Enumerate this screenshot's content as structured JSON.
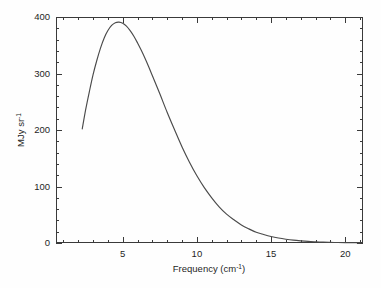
{
  "chart_data": {
    "type": "line",
    "title": "",
    "subtitle": "",
    "xlabel": "Frequency (cm",
    "xlabel_sup": "-1",
    "xlabel_tail": ")",
    "ylabel": "MJy sr",
    "ylabel_sup": "-1",
    "xlim": [
      0.5,
      21.2
    ],
    "ylim": [
      0,
      400
    ],
    "xticks": [
      5,
      10,
      15,
      20
    ],
    "xtick_labels": [
      "5",
      "10",
      "15",
      "20"
    ],
    "xminor_step": 1,
    "yticks": [
      0,
      100,
      200,
      300,
      400
    ],
    "ytick_labels": [
      "0",
      "100",
      "200",
      "300",
      "400"
    ],
    "yminor_step": 20,
    "grid": false,
    "legend": null,
    "line_color": "#4a4a4a",
    "axis_color": "#3a3a3a",
    "background": "#fefefe",
    "series": [
      {
        "name": "CMB blackbody spectrum",
        "description": "Planck blackbody intensity at T = 2.725 K plotted against wavenumber",
        "x": [
          2.27,
          2.5,
          2.75,
          3.0,
          3.25,
          3.5,
          3.75,
          4.0,
          4.25,
          4.5,
          4.75,
          5.0,
          5.25,
          5.5,
          5.75,
          6.0,
          6.25,
          6.5,
          6.75,
          7.0,
          7.5,
          8.0,
          8.5,
          9.0,
          9.5,
          10.0,
          10.5,
          11.0,
          11.5,
          12.0,
          12.5,
          13.0,
          13.5,
          14.0,
          14.5,
          15.0,
          15.5,
          16.0,
          16.5,
          17.0,
          17.5,
          18.0,
          18.5,
          19.0,
          19.5,
          20.0,
          20.5,
          21.0
        ],
        "y": [
          202,
          236,
          268,
          298,
          323,
          345,
          363,
          376,
          385,
          390,
          391,
          389,
          384,
          376,
          366,
          354,
          341,
          327,
          312,
          296,
          264,
          231,
          200,
          170,
          143,
          119,
          98,
          80,
          64,
          51,
          41,
          32,
          25,
          19,
          15,
          11.5,
          8.8,
          6.7,
          5.0,
          3.8,
          2.8,
          2.1,
          1.5,
          1.1,
          0.8,
          0.6,
          0.45,
          0.32
        ],
        "peak_x": 5.4,
        "peak_y": 390,
        "units_x": "cm^-1",
        "units_y": "MJy/sr"
      }
    ]
  },
  "figure": {
    "frame": {
      "left": 56,
      "right": 363,
      "top": 17,
      "bottom": 243
    }
  }
}
